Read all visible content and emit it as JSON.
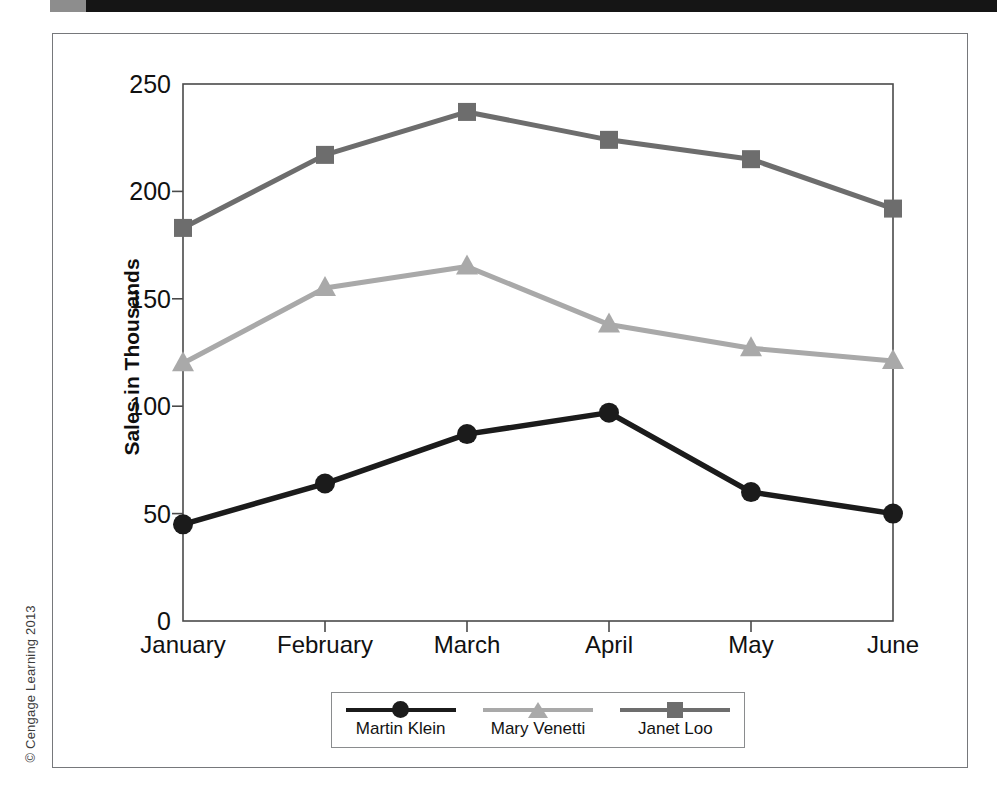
{
  "figure": {
    "credit": "© Cengage Learning 2013"
  },
  "chart_data": {
    "type": "line",
    "title": "",
    "xlabel": "",
    "ylabel": "Sales in Thousands",
    "categories": [
      "January",
      "February",
      "March",
      "April",
      "May",
      "June"
    ],
    "ylim": [
      0,
      250
    ],
    "yticks": [
      0,
      50,
      100,
      150,
      200,
      250
    ],
    "ytick_labels": [
      "0",
      "50",
      "100",
      "150",
      "200",
      "250"
    ],
    "grid": false,
    "legend_position": "bottom",
    "series": [
      {
        "name": "Martin Klein",
        "values": [
          45,
          64,
          87,
          97,
          60,
          50
        ],
        "color": "#1b1b1b",
        "marker": "circle"
      },
      {
        "name": "Mary Venetti",
        "values": [
          120,
          155,
          165,
          138,
          127,
          121
        ],
        "color": "#a9a9a9",
        "marker": "triangle"
      },
      {
        "name": "Janet Loo",
        "values": [
          183,
          217,
          237,
          224,
          215,
          192
        ],
        "color": "#6d6d6d",
        "marker": "square"
      }
    ]
  },
  "colors": {
    "frame": "#76787b",
    "axis": "#4a4a4a",
    "top_bar": "#151515"
  }
}
